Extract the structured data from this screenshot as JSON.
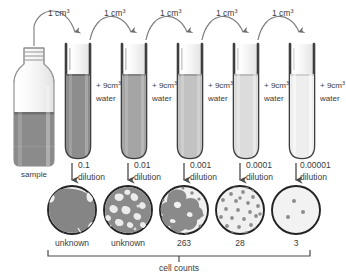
{
  "diagram": {
    "background_color": "#ffffff",
    "ink_color": "#3a3a3a",
    "transfer_label": "1 cm",
    "transfer_label_sup": "3",
    "diluent_label_prefix": "+ 9cm",
    "diluent_label_sup": "3",
    "diluent_label_suffix": "water",
    "dilution_word": "dilution",
    "sample_label": "sample",
    "bracket_label": "cell counts",
    "transfers": [
      {
        "label": "1 cm",
        "sup": "3"
      },
      {
        "label": "1 cm",
        "sup": "3"
      },
      {
        "label": "1 cm",
        "sup": "3"
      },
      {
        "label": "1 cm",
        "sup": "3"
      },
      {
        "label": "1 cm",
        "sup": "3"
      }
    ],
    "tubes": [
      {
        "diluent": "+ 9cm",
        "sup": "3",
        "water": "water",
        "fill_color": "#8d8d8d"
      },
      {
        "diluent": "+ 9cm",
        "sup": "3",
        "water": "water",
        "fill_color": "#a5a5a5"
      },
      {
        "diluent": "+ 9cm",
        "sup": "3",
        "water": "water",
        "fill_color": "#c2c2c2"
      },
      {
        "diluent": "+ 9cm",
        "sup": "3",
        "water": "water",
        "fill_color": "#dcdcdc"
      },
      {
        "diluent": "+ 9cm",
        "sup": "3",
        "water": "water",
        "fill_color": "#eeeeee"
      }
    ],
    "dilutions": [
      {
        "factor": "0.1",
        "word": "dilution"
      },
      {
        "factor": "0.01",
        "word": "dilution"
      },
      {
        "factor": "0.001",
        "word": "dilution"
      },
      {
        "factor": "0.0001",
        "word": "dilution"
      },
      {
        "factor": "0.00001",
        "word": "dilution"
      }
    ],
    "plates": [
      {
        "count_label": "unknown",
        "density": "confluent-lawn",
        "colonies": 0
      },
      {
        "count_label": "unknown",
        "density": "near-confluent",
        "colonies": 0
      },
      {
        "count_label": "263",
        "density": "crowded-merging",
        "colonies": 263
      },
      {
        "count_label": "28",
        "density": "countable",
        "colonies": 28
      },
      {
        "count_label": "3",
        "density": "sparse",
        "colonies": 3
      }
    ]
  }
}
